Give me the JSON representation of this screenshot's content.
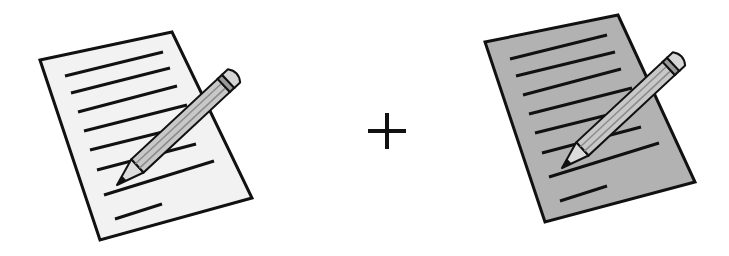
{
  "scene": {
    "description": "Two document-with-pencil icons combined by a plus sign",
    "operator": "+",
    "left_icon": {
      "name": "document-pencil",
      "paper_fill": "#f2f2f2",
      "line_count": 8
    },
    "right_icon": {
      "name": "document-pencil-shaded",
      "paper_fill": "#b2b2b2",
      "line_count": 8
    },
    "colors": {
      "stroke": "#111111",
      "pencil_body": "#c8c8c8",
      "pencil_stripe": "#9a9a9a",
      "pencil_cone": "#dcdcdc",
      "eraser": "#d6d6d6",
      "lead": "#111111",
      "background": "#ffffff"
    }
  }
}
